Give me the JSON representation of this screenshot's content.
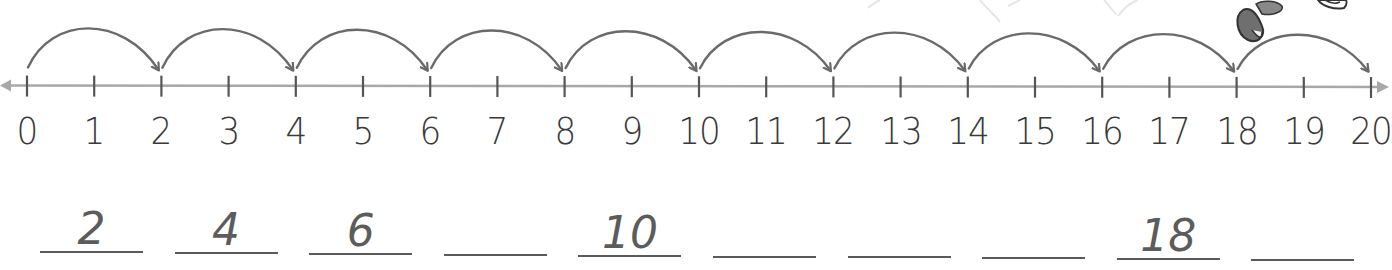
{
  "colors": {
    "axis": "#a8a8a8",
    "tick": "#555555",
    "arc": "#6a6a6a",
    "label": "#3a3a3a",
    "answer": "#5c5c5c",
    "blank_line": "#5a5a5a"
  },
  "number_line": {
    "min": 0,
    "max": 20,
    "tick_labels": [
      "0",
      "1",
      "2",
      "3",
      "4",
      "5",
      "6",
      "7",
      "8",
      "9",
      "10",
      "11",
      "12",
      "13",
      "14",
      "15",
      "16",
      "17",
      "18",
      "19",
      "20"
    ],
    "hop_size": 2,
    "hops": [
      {
        "from": 0,
        "to": 2
      },
      {
        "from": 2,
        "to": 4
      },
      {
        "from": 4,
        "to": 6
      },
      {
        "from": 6,
        "to": 8
      },
      {
        "from": 8,
        "to": 10
      },
      {
        "from": 10,
        "to": 12
      },
      {
        "from": 12,
        "to": 14
      },
      {
        "from": 14,
        "to": 16
      },
      {
        "from": 16,
        "to": 18
      },
      {
        "from": 18,
        "to": 20
      }
    ]
  },
  "answers": {
    "blanks": [
      {
        "value": "2"
      },
      {
        "value": "4"
      },
      {
        "value": "6"
      },
      {
        "value": ""
      },
      {
        "value": "10"
      },
      {
        "value": ""
      },
      {
        "value": ""
      },
      {
        "value": ""
      },
      {
        "value": "18"
      },
      {
        "value": ""
      }
    ]
  }
}
